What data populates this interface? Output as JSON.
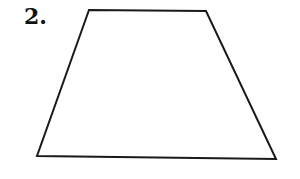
{
  "problem": {
    "number_label": "2."
  },
  "figure": {
    "shape": "trapezoid",
    "stroke_color": "#1a1a1a",
    "fill_color": "#ffffff",
    "stroke_width": 2,
    "vertices": [
      {
        "name": "top-left",
        "x": 89,
        "y": 10
      },
      {
        "name": "top-right",
        "x": 206,
        "y": 11
      },
      {
        "name": "bottom-right",
        "x": 276,
        "y": 159
      },
      {
        "name": "bottom-left",
        "x": 37,
        "y": 156
      }
    ],
    "points": "89,10 206,11 276,159 37,156"
  }
}
